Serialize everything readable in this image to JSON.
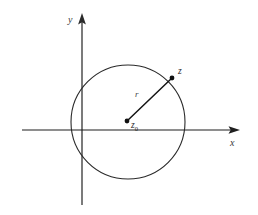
{
  "figure": {
    "background_color": "#ffffff",
    "axes": {
      "x_axis": {
        "label": "x",
        "color": "#1f1f1f",
        "start_x": 22,
        "end_x": 240,
        "y": 130,
        "arrow": "right"
      },
      "y_axis": {
        "label": "y",
        "color": "#5a5a5a",
        "x": 82,
        "start_y": 205,
        "end_y": 14,
        "arrow": "up"
      }
    },
    "circle": {
      "center_x": 128,
      "center_y": 122,
      "radius": 57,
      "stroke_color": "#2a2a2a",
      "stroke_width": 1.1,
      "fill": "none"
    },
    "points": [
      {
        "name": "center-point",
        "label": "z",
        "sublabel": "0",
        "x": 127,
        "y": 121,
        "marker_radius": 2.4,
        "color": "#111111"
      },
      {
        "name": "boundary-point",
        "label": "z",
        "sublabel": "",
        "x": 172,
        "y": 78,
        "marker_radius": 2.4,
        "color": "#111111"
      }
    ],
    "radius_segment": {
      "label": "r",
      "from_x": 127,
      "from_y": 121,
      "to_x": 172,
      "to_y": 78,
      "stroke_color": "#141414",
      "stroke_width": 1.5
    }
  }
}
